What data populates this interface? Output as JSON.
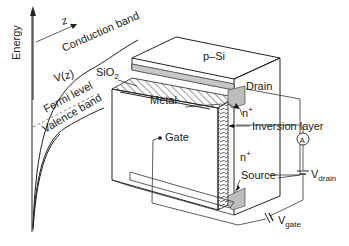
{
  "energy_diagram": {
    "axis_label": "Energy",
    "z_label": "z",
    "conduction_band": "Conduction band",
    "potential_label": "V(z)",
    "fermi_level": "Fermi level",
    "valence_band": "Valence band"
  },
  "device": {
    "substrate": "p–Si",
    "oxide": "SiO",
    "oxide_sub": "2",
    "metal": "Metal",
    "gate": "Gate",
    "drain": "Drain",
    "source": "Source",
    "n_plus_top": "n",
    "n_plus_bottom": "n",
    "n_sup": "+",
    "inversion_layer": "Inversion layer"
  },
  "circuit": {
    "ammeter": "A",
    "v_drain": "V",
    "v_drain_sub": "drain",
    "v_gate": "V",
    "v_gate_sub": "gate"
  }
}
